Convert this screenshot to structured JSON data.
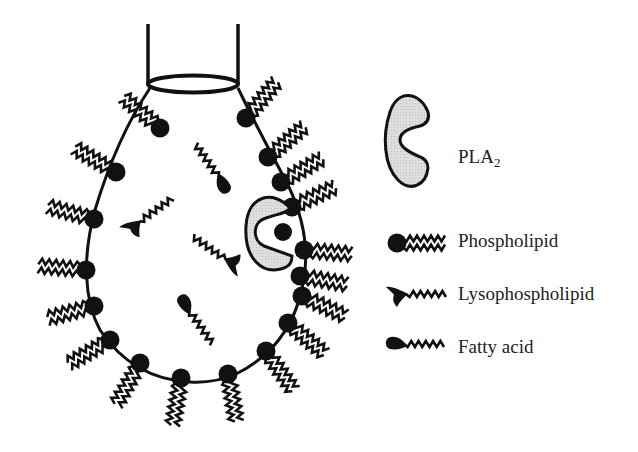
{
  "diagram": {
    "colors": {
      "ink": "#111111",
      "enzyme_fill": "#d9d9d9",
      "background": "#ffffff"
    },
    "legend": {
      "enzyme": {
        "label": "PLA",
        "subscript": "2",
        "icon": "pla2-enzyme-icon"
      },
      "items": [
        {
          "label": "Phospholipid",
          "icon": "phospholipid-icon"
        },
        {
          "label": "Lysophospholipid",
          "icon": "lysophospholipid-icon"
        },
        {
          "label": "Fatty acid",
          "icon": "fatty-acid-icon"
        }
      ]
    },
    "membrane_phospholipid_count": 26,
    "interior_molecules": {
      "lysophospholipids": 2,
      "fatty_acids": 2
    }
  }
}
